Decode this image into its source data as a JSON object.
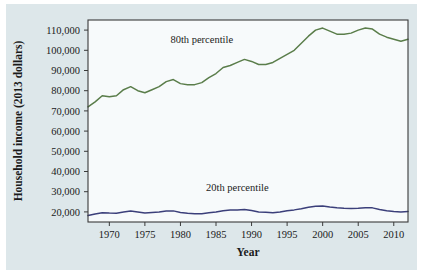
{
  "chart_data": {
    "type": "line",
    "title": "",
    "xlabel": "Year",
    "ylabel": "Household income (2013 dollars)",
    "xlim": [
      1967,
      2012
    ],
    "ylim": [
      15000,
      115000
    ],
    "grid": false,
    "legend_position": "inline-annotation",
    "xticks": [
      1970,
      1975,
      1980,
      1985,
      1990,
      1995,
      2000,
      2005,
      2010
    ],
    "xtick_labels": [
      "1970",
      "1975",
      "1980",
      "1985",
      "1990",
      "1995",
      "2000",
      "2005",
      "2010"
    ],
    "yticks": [
      20000,
      30000,
      40000,
      50000,
      60000,
      70000,
      80000,
      90000,
      100000,
      110000
    ],
    "ytick_labels": [
      "20,000",
      "30,000",
      "40,000",
      "50,000",
      "60,000",
      "70,000",
      "80,000",
      "90,000",
      "100,000",
      "110,000"
    ],
    "x": [
      1967,
      1968,
      1969,
      1970,
      1971,
      1972,
      1973,
      1974,
      1975,
      1976,
      1977,
      1978,
      1979,
      1980,
      1981,
      1982,
      1983,
      1984,
      1985,
      1986,
      1987,
      1988,
      1989,
      1990,
      1991,
      1992,
      1993,
      1994,
      1995,
      1996,
      1997,
      1998,
      1999,
      2000,
      2001,
      2002,
      2003,
      2004,
      2005,
      2006,
      2007,
      2008,
      2009,
      2010,
      2011,
      2012
    ],
    "series": [
      {
        "name": "80th percentile",
        "color": "#5a7d4a",
        "label_x": 1983,
        "label_y": 103500,
        "values": [
          72000,
          74500,
          77500,
          77000,
          77500,
          80500,
          82000,
          80000,
          79000,
          80500,
          82000,
          84500,
          85500,
          83500,
          83000,
          83000,
          84000,
          86500,
          88500,
          91500,
          92500,
          94000,
          95500,
          94500,
          93000,
          93000,
          94000,
          96000,
          98000,
          100000,
          103500,
          107000,
          110000,
          111000,
          109500,
          108000,
          108000,
          108500,
          110000,
          111000,
          110500,
          108000,
          106500,
          105500,
          104500,
          105500
        ]
      },
      {
        "name": "20th percentile",
        "color": "#3b3f7a",
        "label_x": 1988,
        "label_y": 30500,
        "values": [
          18200,
          19000,
          19600,
          19400,
          19300,
          19900,
          20400,
          20000,
          19400,
          19700,
          19900,
          20400,
          20500,
          19700,
          19300,
          19100,
          19100,
          19600,
          20000,
          20600,
          20900,
          21000,
          21200,
          20700,
          20000,
          19800,
          19600,
          20000,
          20600,
          21000,
          21600,
          22300,
          22800,
          22900,
          22400,
          22000,
          21800,
          21700,
          21800,
          22000,
          22000,
          21200,
          20600,
          20200,
          20000,
          20200
        ]
      }
    ]
  }
}
